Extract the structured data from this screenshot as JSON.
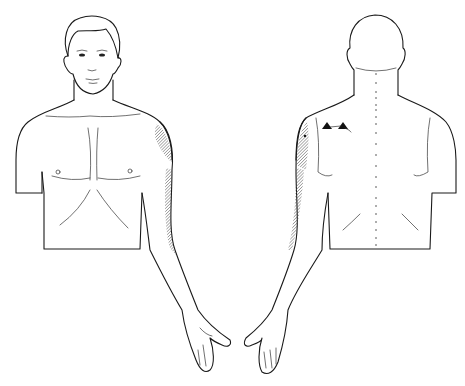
{
  "figure": {
    "views": [
      {
        "name": "front-view",
        "label": ""
      },
      {
        "name": "back-view",
        "label": ""
      }
    ],
    "markers": {
      "trigger_points": 2,
      "pain_area_style": "hatched",
      "pain_area_color": "#555555",
      "line_color": "#1a1a1a",
      "background": "#ffffff"
    }
  }
}
